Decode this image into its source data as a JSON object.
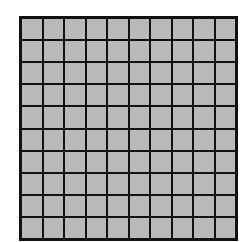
{
  "diagram": {
    "type": "grid",
    "rows": 10,
    "columns": 10,
    "cell_count": 100,
    "shaded_cells": 100,
    "colors": {
      "cell_fill": "#b9b9b9",
      "grid_line": "#111111",
      "background": "#ffffff"
    }
  }
}
